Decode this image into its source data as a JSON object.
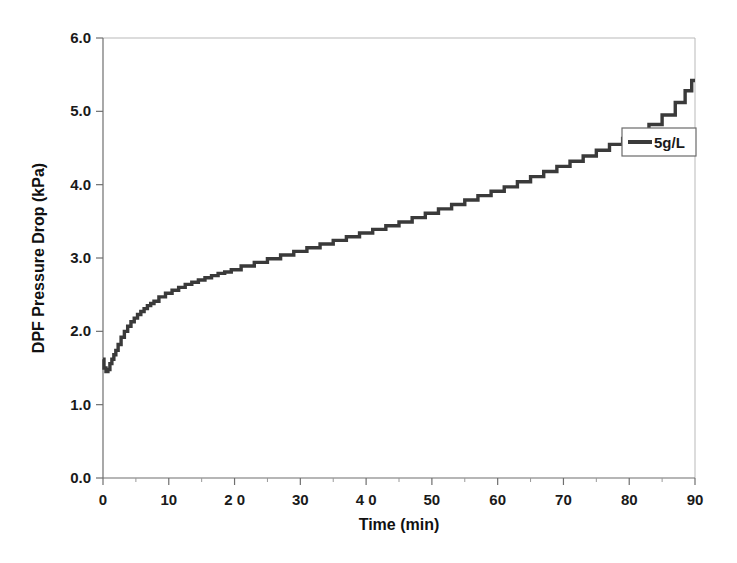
{
  "chart_data": {
    "type": "line",
    "title": "",
    "xlabel": "Time (min)",
    "ylabel": "DPF Pressure Drop (kPa)",
    "xlim": [
      0,
      90
    ],
    "ylim": [
      0,
      6
    ],
    "xticks": [
      0,
      10,
      20,
      30,
      40,
      50,
      60,
      70,
      80,
      90
    ],
    "xtick_labels": [
      "0",
      "10",
      "2 0",
      "30",
      "4 0",
      "50",
      "60",
      "70",
      "80",
      "90"
    ],
    "yticks": [
      0,
      1,
      2,
      3,
      4,
      5,
      6
    ],
    "ytick_labels": [
      "0.0",
      "1.0",
      "2.0",
      "3.0",
      "4.0",
      "5.0",
      "6.0"
    ],
    "grid": false,
    "legend_position": "upper-right",
    "line_color": "#3a3a3a",
    "series": [
      {
        "name": "5g/L",
        "color": "#3a3a3a",
        "x": [
          0.0,
          0.3,
          0.6,
          0.9,
          1.2,
          1.5,
          1.8,
          2.1,
          2.5,
          3.0,
          3.5,
          4.0,
          4.5,
          5.0,
          5.5,
          6.0,
          6.5,
          7.0,
          7.5,
          8.0,
          9.0,
          10.0,
          11.0,
          12.0,
          13.0,
          14.0,
          15.0,
          16.0,
          17.0,
          18.0,
          19.0,
          20.0,
          22.0,
          24.0,
          26.0,
          28.0,
          30.0,
          32.0,
          34.0,
          36.0,
          38.0,
          40.0,
          42.0,
          44.0,
          46.0,
          48.0,
          50.0,
          52.0,
          54.0,
          56.0,
          58.0,
          60.0,
          62.0,
          64.0,
          66.0,
          68.0,
          70.0,
          72.0,
          74.0,
          76.0,
          78.0,
          80.0,
          82.0,
          84.0,
          86.0,
          88.0,
          89.0,
          90.0
        ],
        "y": [
          1.62,
          1.5,
          1.45,
          1.48,
          1.56,
          1.62,
          1.68,
          1.74,
          1.82,
          1.92,
          2.0,
          2.07,
          2.13,
          2.18,
          2.23,
          2.27,
          2.31,
          2.35,
          2.38,
          2.41,
          2.47,
          2.52,
          2.56,
          2.6,
          2.64,
          2.67,
          2.7,
          2.73,
          2.76,
          2.79,
          2.81,
          2.84,
          2.89,
          2.94,
          2.99,
          3.04,
          3.09,
          3.14,
          3.19,
          3.24,
          3.29,
          3.34,
          3.39,
          3.44,
          3.49,
          3.55,
          3.61,
          3.67,
          3.73,
          3.79,
          3.85,
          3.91,
          3.97,
          4.04,
          4.11,
          4.18,
          4.25,
          4.32,
          4.39,
          4.47,
          4.55,
          4.63,
          4.72,
          4.82,
          4.95,
          5.12,
          5.28,
          5.42
        ]
      }
    ],
    "legend_entries": [
      {
        "label": "5g/L",
        "color": "#3a3a3a"
      }
    ]
  },
  "legend": {
    "entry_label": "5g/L"
  },
  "axes": {
    "x_title": "Time (min)",
    "y_title": "DPF Pressure Drop (kPa)"
  }
}
